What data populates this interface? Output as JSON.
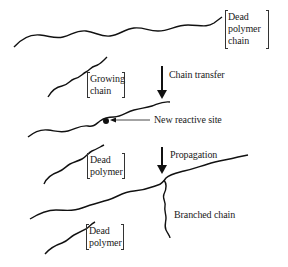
{
  "diagram": {
    "type": "reaction-scheme",
    "labels": {
      "dead_polymer_chain": [
        "Dead",
        "polymer",
        "chain"
      ],
      "growing_chain": [
        "Growing",
        "chain"
      ],
      "chain_transfer": "Chain transfer",
      "new_reactive_site": "New reactive site",
      "dead_polymer_1": [
        "Dead",
        "polymer"
      ],
      "propagation": "Propagation",
      "branched_chain": "Branched chain",
      "dead_polymer_2": [
        "Dead",
        "polymer"
      ]
    },
    "steps": [
      {
        "name": "Chain transfer",
        "from": "Dead polymer chain + Growing chain",
        "to": "Polymer with new reactive site + Dead polymer"
      },
      {
        "name": "Propagation",
        "from": "Polymer with new reactive site",
        "to": "Branched chain"
      }
    ],
    "colors": {
      "line": "#111111",
      "background": "#ffffff"
    }
  }
}
